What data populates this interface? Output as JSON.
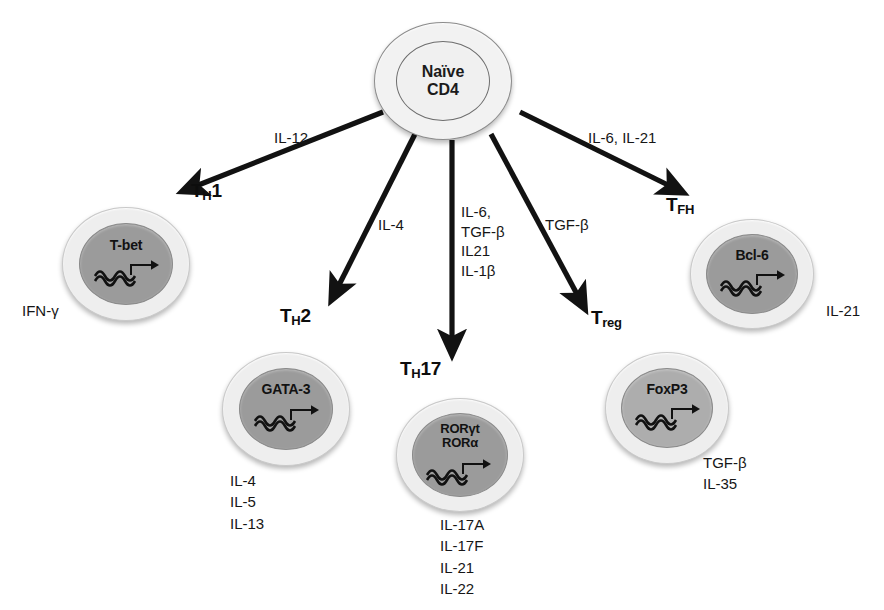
{
  "diagram": {
    "background": "#ffffff",
    "colors": {
      "cytoplasm": "#eeeeee",
      "nucleus": "#9b9b9b",
      "naive_nucleus": "#f0f0f0",
      "stroke": "#121212"
    }
  },
  "source_cell": {
    "name": "naive-cd4-cell",
    "line1": "Naïve",
    "line2": "CD4"
  },
  "branches": [
    {
      "id": "th1",
      "subset_main": "T",
      "subset_sub": "H",
      "subset_tail": "1",
      "subset_full": "TH1",
      "inducing_cytokines": "IL-12",
      "transcription_factors": [
        "T-bet"
      ],
      "effector_cytokines": [
        "IFN-γ"
      ]
    },
    {
      "id": "th2",
      "subset_main": "T",
      "subset_sub": "H",
      "subset_tail": "2",
      "subset_full": "TH2",
      "inducing_cytokines": "IL-4",
      "transcription_factors": [
        "GATA-3"
      ],
      "effector_cytokines": [
        "IL-4",
        "IL-5",
        "IL-13"
      ]
    },
    {
      "id": "th17",
      "subset_main": "T",
      "subset_sub": "H",
      "subset_tail": "17",
      "subset_full": "TH17",
      "inducing_cytokines": "IL-6,\nTGF-β\nIL21\nIL-1β",
      "inducing_lines": [
        "IL-6,",
        "TGF-β",
        "IL21",
        "IL-1β"
      ],
      "transcription_factors": [
        "RORγt",
        "RORα"
      ],
      "effector_cytokines": [
        "IL-17A",
        "IL-17F",
        "IL-21",
        "IL-22"
      ]
    },
    {
      "id": "treg",
      "subset_main": "T",
      "subset_sub": "reg",
      "subset_tail": "",
      "subset_full": "Treg",
      "inducing_cytokines": "TGF-β",
      "transcription_factors": [
        "FoxP3"
      ],
      "effector_cytokines": [
        "TGF-β",
        "IL-35"
      ]
    },
    {
      "id": "tfh",
      "subset_main": "T",
      "subset_sub": "FH",
      "subset_tail": "",
      "subset_full": "TFH",
      "inducing_cytokines": "IL-6, IL-21",
      "transcription_factors": [
        "Bcl-6"
      ],
      "effector_cytokines": [
        "IL-21"
      ]
    }
  ],
  "caption_fragment": ""
}
